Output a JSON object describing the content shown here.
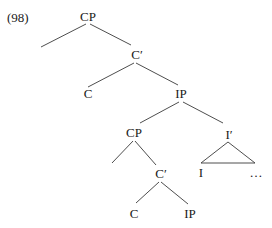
{
  "example_number": "(98)",
  "tree": {
    "root": {
      "label": "CP"
    },
    "root_bar": {
      "label": "C′"
    },
    "root_head": {
      "label": "C"
    },
    "ip": {
      "label": "IP"
    },
    "spec_cp": {
      "label": "CP"
    },
    "i_bar": {
      "label": "I′"
    },
    "i_head": {
      "label": "I"
    },
    "i_rest": {
      "label": "…"
    },
    "spec_cp_bar": {
      "label": "C′"
    },
    "spec_cp_head": {
      "label": "C"
    },
    "spec_cp_ip": {
      "label": "IP"
    }
  },
  "colors": {
    "text": "#1a1a1a",
    "lines": "#3a3a3a",
    "background": "#ffffff"
  }
}
